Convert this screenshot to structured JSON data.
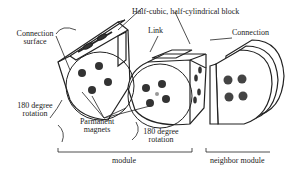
{
  "figure": {
    "labels": {
      "connection_surface_line1": "Connection",
      "connection_surface_line2": "surface",
      "block": "Half-cubic, half-cylindrical block",
      "link": "Link",
      "connection": "Connection",
      "rotation_left_line1": "180 degree",
      "rotation_left_line2": "rotation",
      "magnets_line1": "Parmanent",
      "magnets_line2": "magnets",
      "rotation_right_line1": "180 degree",
      "rotation_right_line2": "rotation",
      "module": "module",
      "neighbor_module": "neighbor module"
    },
    "colors": {
      "stroke": "#222222",
      "magnet": "#333333",
      "light_line": "#999999",
      "background": "#ffffff"
    }
  }
}
